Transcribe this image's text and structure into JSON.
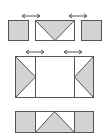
{
  "figure": {
    "colors": {
      "stroke": "#555555",
      "shade": "#d3d3d3",
      "background": "#ffffff"
    },
    "stages": [
      {
        "id": "stage-1",
        "panels": [
          "left-square-shaded",
          "center-rect-with-down-triangle",
          "right-square-shaded"
        ],
        "arrows": [
          "double-arrow-left",
          "double-arrow-right"
        ]
      },
      {
        "id": "stage-2",
        "panels": [
          "left-section-with-right-triangle",
          "center-blank",
          "right-section-with-left-triangle"
        ],
        "arrows": [
          "double-arrow-left",
          "double-arrow-right"
        ]
      },
      {
        "id": "stage-3",
        "panels": [
          "left-section-shaded",
          "center-with-up-triangle",
          "right-section-shaded"
        ],
        "arrows": []
      }
    ]
  }
}
